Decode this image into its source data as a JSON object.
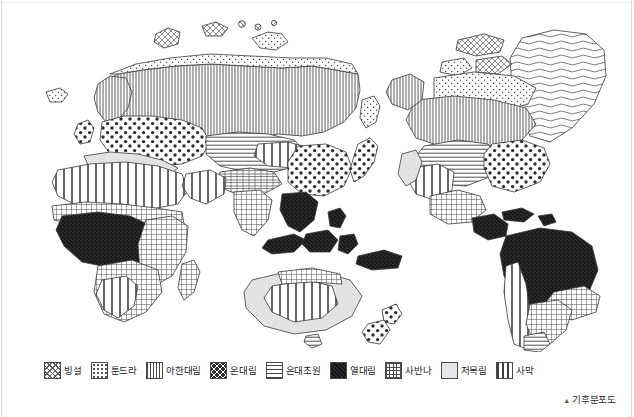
{
  "figure": {
    "caption_marker": "▲",
    "caption": "기후분포도"
  },
  "legend": {
    "items": [
      {
        "label": "빙설",
        "pattern": "ice-dense-crosshatch",
        "swatch_fill": "pat-ice"
      },
      {
        "label": "툰드라",
        "pattern": "fine-stipple-dots",
        "swatch_fill": "pat-tundra"
      },
      {
        "label": "아한대림",
        "pattern": "vertical-thin-lines",
        "swatch_fill": "pat-subarctic"
      },
      {
        "label": "온대림",
        "pattern": "bold-dots",
        "swatch_fill": "pat-temperate-forest"
      },
      {
        "label": "온대초원",
        "pattern": "horizontal-lines",
        "swatch_fill": "pat-temperate-grass"
      },
      {
        "label": "열대림",
        "pattern": "solid-dark",
        "swatch_fill": "pat-tropical"
      },
      {
        "label": "사반나",
        "pattern": "dense-grid-hatch",
        "swatch_fill": "pat-savanna"
      },
      {
        "label": "저목림",
        "pattern": "light-blank",
        "swatch_fill": "pat-shrub"
      },
      {
        "label": "사막",
        "pattern": "wide-vertical-bars",
        "swatch_fill": "pat-desert"
      }
    ]
  },
  "map": {
    "title": "세계 기후분포도",
    "type": "thematic-world-map",
    "projection": "equirectangular-sketch",
    "regions": [
      {
        "name": "greenland",
        "climate": "빙설"
      },
      {
        "name": "arctic-canada",
        "climate": "툰드라"
      },
      {
        "name": "northern-siberia",
        "climate": "툰드라"
      },
      {
        "name": "siberia-taiga",
        "climate": "아한대림"
      },
      {
        "name": "scandinavia",
        "climate": "아한대림"
      },
      {
        "name": "canada-boreal",
        "climate": "아한대림"
      },
      {
        "name": "europe",
        "climate": "온대림"
      },
      {
        "name": "east-asia",
        "climate": "온대림"
      },
      {
        "name": "eastern-usa",
        "climate": "온대림"
      },
      {
        "name": "great-plains",
        "climate": "온대초원"
      },
      {
        "name": "central-asia",
        "climate": "온대초원"
      },
      {
        "name": "pampas",
        "climate": "온대초원"
      },
      {
        "name": "amazon-basin",
        "climate": "열대림"
      },
      {
        "name": "congo-basin",
        "climate": "열대림"
      },
      {
        "name": "southeast-asia",
        "climate": "열대림"
      },
      {
        "name": "sudan-sahel",
        "climate": "사반나"
      },
      {
        "name": "east-africa",
        "climate": "사반나"
      },
      {
        "name": "brazil-cerrado",
        "climate": "사반나"
      },
      {
        "name": "northern-australia",
        "climate": "사반나"
      },
      {
        "name": "mediterranean",
        "climate": "저목림"
      },
      {
        "name": "california",
        "climate": "저목림"
      },
      {
        "name": "southwest-australia",
        "climate": "저목림"
      },
      {
        "name": "sahara",
        "climate": "사막"
      },
      {
        "name": "arabia",
        "climate": "사막"
      },
      {
        "name": "central-australia",
        "climate": "사막"
      },
      {
        "name": "atacama",
        "climate": "사막"
      },
      {
        "name": "kalahari",
        "climate": "사막"
      }
    ]
  }
}
